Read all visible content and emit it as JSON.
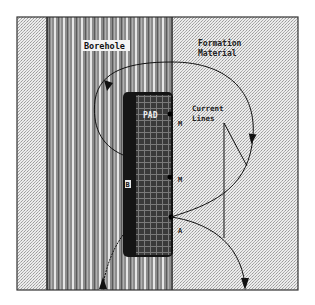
{
  "diagram": {
    "labels": {
      "borehole": "Borehole",
      "formation_line1": "Formation",
      "formation_line2": "Material",
      "pad": "PAD",
      "current_line1": "Current",
      "current_line2": "Lines",
      "electrode_m1": "M",
      "electrode_m2": "M",
      "electrode_a": "A",
      "electrode_b": "B"
    },
    "colors": {
      "borehole_base": "#8a8a8a",
      "borehole_stripe_light": "#e8e8e8",
      "borehole_stripe_dark": "#555555",
      "formation_base": "#dcdcdc",
      "pad_body": "#1a1a1a",
      "pad_grid": "#4a4a4a",
      "line": "#111111",
      "frame": "#333333"
    }
  }
}
